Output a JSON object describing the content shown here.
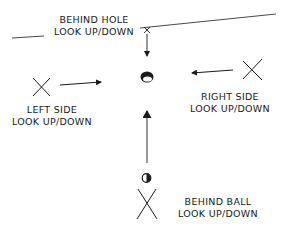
{
  "diagram": {
    "type": "golf putting read positions",
    "colors": {
      "ink": "#1a1a1a",
      "background": "#ffffff"
    },
    "positions": [
      {
        "id": "behind-hole",
        "line1": "BEHIND HOLE",
        "line2": "LOOK UP/DOWN"
      },
      {
        "id": "left-side",
        "line1": "LEFT SIDE",
        "line2": "LOOK UP/DOWN"
      },
      {
        "id": "right-side",
        "line1": "RIGHT SIDE",
        "line2": "LOOK UP/DOWN"
      },
      {
        "id": "behind-ball",
        "line1": "BEHIND BALL",
        "line2": "LOOK UP/DOWN"
      }
    ],
    "elements": {
      "hole": "hole-icon",
      "ball": "golf-ball-icon",
      "markers": "x-mark-icon",
      "arrows": "arrow-icon",
      "horizon": "horizon-line"
    }
  }
}
